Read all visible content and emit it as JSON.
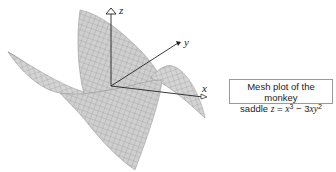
{
  "figure": {
    "type": "3d-mesh-plot",
    "function": "z = x^3 - 3xy^2",
    "surface_name": "monkey saddle",
    "axes": {
      "x_label": "x",
      "y_label": "y",
      "z_label": "z"
    },
    "colors": {
      "mesh_fill": "#d4d4d4",
      "mesh_lines": "#8c8c8c",
      "axis": "#222222",
      "caption_border": "#9a9a9a"
    }
  },
  "caption": {
    "line1": "Mesh plot of the monkey",
    "line2_prefix": "saddle ",
    "z": "z",
    "eq": " = ",
    "x": "x",
    "exp3": "3",
    "minus": " − 3",
    "xy": "xy",
    "exp2": "2"
  }
}
